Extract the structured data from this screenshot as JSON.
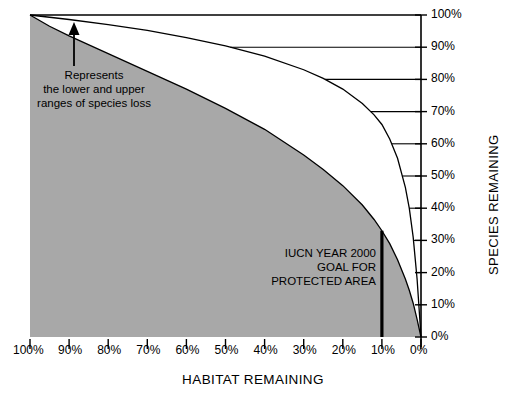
{
  "chart_data": {
    "type": "area",
    "title": "",
    "xlabel": "HABITAT REMAINING",
    "ylabel": "SPECIES REMAINING",
    "xlim": [
      100,
      0
    ],
    "ylim": [
      0,
      100
    ],
    "x_ticks": [
      "100%",
      "90%",
      "80%",
      "70%",
      "60%",
      "50%",
      "40%",
      "30%",
      "20%",
      "10%",
      "0%"
    ],
    "y_ticks": [
      "100%",
      "90%",
      "80%",
      "70%",
      "60%",
      "50%",
      "40%",
      "30%",
      "20%",
      "10%",
      "0%"
    ],
    "grid": "horizontal",
    "legend_position": "none",
    "series": [
      {
        "name": "Upper range of species loss",
        "note": "upper bounding curve - species remaining vs habitat remaining",
        "x": [
          100,
          95,
          90,
          80,
          70,
          60,
          50,
          40,
          30,
          25,
          20,
          15,
          12,
          10,
          8,
          6,
          4,
          3,
          2,
          1,
          0
        ],
        "values": [
          100,
          99.3,
          98.6,
          97,
          95.2,
          93,
          90.4,
          87.2,
          83,
          80.3,
          77,
          72.5,
          69,
          66,
          61.5,
          55.5,
          46.5,
          40,
          31,
          18,
          0
        ]
      },
      {
        "name": "Lower range of species loss",
        "note": "lower bounding curve - edge of shaded region",
        "x": [
          100,
          95,
          90,
          80,
          70,
          60,
          50,
          40,
          30,
          25,
          20,
          15,
          12,
          10,
          8,
          6,
          4,
          3,
          2,
          1,
          0
        ],
        "values": [
          100,
          96.5,
          93.5,
          88,
          82.5,
          77,
          71,
          64.5,
          56.5,
          52,
          47,
          41,
          36.5,
          33,
          29,
          24,
          18,
          14.5,
          10.5,
          5.5,
          0
        ]
      }
    ],
    "shaded_region": {
      "fill_color": "#a8a8a8",
      "description": "Range between lower and upper estimates of species loss"
    },
    "annotations": [
      {
        "name": "range-annotation",
        "text_lines": [
          "Represents",
          "the lower and upper",
          "ranges of species loss"
        ],
        "has_arrow": true,
        "arrow_points_to": "shaded region boundary"
      },
      {
        "name": "iucn-goal-annotation",
        "text_lines": [
          "IUCN YEAR 2000",
          "GOAL FOR",
          "PROTECTED AREA"
        ],
        "marker": "vertical-line",
        "marker_x_value": "10%"
      }
    ]
  },
  "axes": {
    "x_title": "HABITAT REMAINING",
    "y_title": "SPECIES REMAINING"
  },
  "colors": {
    "fill": "#a8a8a8",
    "line": "#000000",
    "background": "#ffffff"
  },
  "annotation_range": {
    "line1": "Represents",
    "line2": "the lower and upper",
    "line3": "ranges of species loss"
  },
  "annotation_iucn": {
    "line1": "IUCN YEAR 2000",
    "line2": "GOAL FOR",
    "line3": "PROTECTED AREA"
  }
}
